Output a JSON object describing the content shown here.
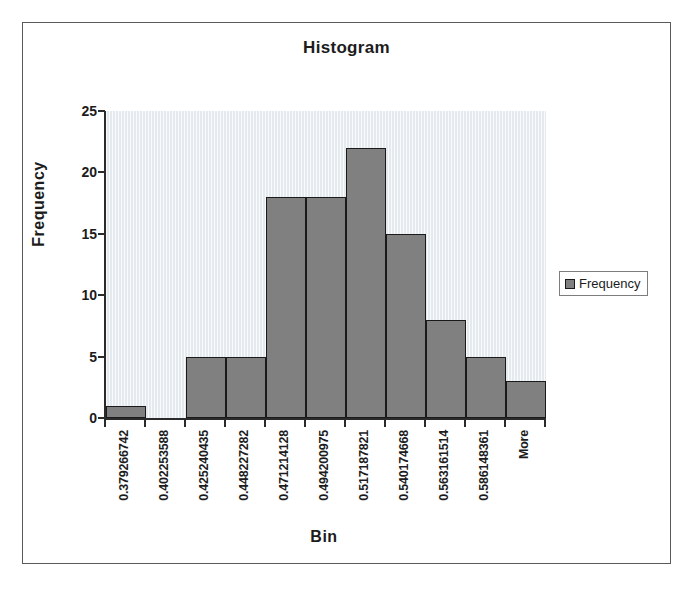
{
  "chart": {
    "title": "Histogram",
    "legend": {
      "entries": [
        "Frequency"
      ],
      "position": "right",
      "swatch_color": "#808080"
    },
    "style": {
      "bar_fill": "#808080",
      "bar_border": "#1a1a1a",
      "plot_background": "#eef1f4",
      "axis_color": "#2b2b2b",
      "frame_border": "#5a5a5a",
      "text_color": "#1c1c1c"
    }
  },
  "chart_data": {
    "type": "bar",
    "title": "Histogram",
    "xlabel": "Bin",
    "ylabel": "Frequency",
    "ylim": [
      0,
      25
    ],
    "yticks": [
      0,
      5,
      10,
      15,
      20,
      25
    ],
    "grid": false,
    "legend": [
      "Frequency"
    ],
    "legend_position": "right",
    "categories": [
      "0.379266742",
      "0.402253588",
      "0.425240435",
      "0.448227282",
      "0.471214128",
      "0.494200975",
      "0.517187821",
      "0.540174668",
      "0.563161514",
      "0.586148361",
      "More"
    ],
    "series": [
      {
        "name": "Frequency",
        "values": [
          1,
          0,
          5,
          5,
          18,
          18,
          22,
          15,
          8,
          5,
          3
        ]
      }
    ],
    "values": [
      1,
      0,
      5,
      5,
      18,
      18,
      22,
      15,
      8,
      5,
      3
    ]
  }
}
